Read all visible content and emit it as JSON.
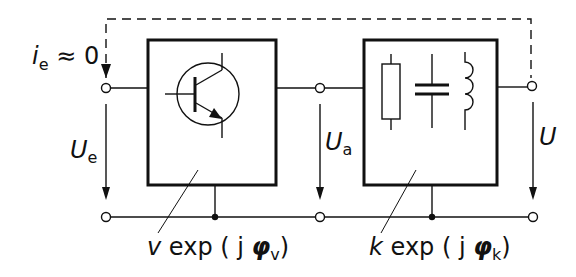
{
  "diagram": {
    "labels": {
      "input_current": {
        "main": "i",
        "sub": "e",
        "rest": " ≈ 0"
      },
      "input_voltage": {
        "main": "U",
        "sub": "e"
      },
      "mid_voltage": {
        "main": "U",
        "sub": "a"
      },
      "output_voltage": {
        "main": "U"
      },
      "amplifier_gain": {
        "prefix": "v",
        "text": " exp ( j ",
        "phi": "φ",
        "sub": "v",
        "close": ")"
      },
      "feedback_gain": {
        "prefix": "k",
        "text": " exp ( j ",
        "phi": "φ",
        "sub": "k",
        "close": ")"
      }
    },
    "blocks": [
      {
        "name": "amplifier",
        "component": "npn-transistor"
      },
      {
        "name": "feedback-network",
        "components": [
          "resistor",
          "capacitor",
          "inductor"
        ]
      }
    ],
    "colors": {
      "line": "#111111",
      "background": "#ffffff"
    }
  }
}
